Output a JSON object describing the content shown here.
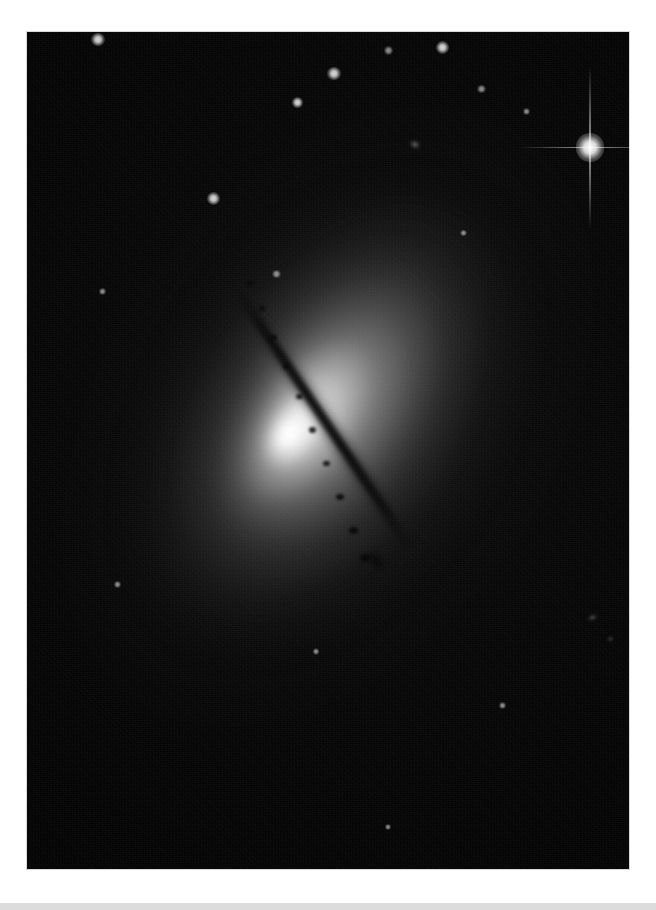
{
  "page": {
    "background_color": "#ffffff",
    "width": 656,
    "height": 910
  },
  "photo": {
    "alt_title": "Edge-on lenticular galaxy with dark dust lane",
    "plate_background": "#040404",
    "border_color": "#d8d8d8",
    "left": 27,
    "top": 32,
    "width": 602,
    "height": 837,
    "subject": "galaxy",
    "orientation_note": "dust lane runs from upper-left to lower-right",
    "core_color": "#ffffff",
    "halo_color": "#9a9a9a",
    "dust_lane_color": "#060606",
    "sky_color": "#050505"
  },
  "galaxy": {
    "name": "edge-on-galaxy",
    "disk_angle_deg": 56,
    "halo_angle_deg": -56,
    "core": {
      "x_pct": 44.5,
      "y_pct": 47.5
    },
    "dust_lane": {
      "start_x_pct": 35,
      "start_y_pct": 27,
      "end_x_pct": 58,
      "end_y_pct": 64
    }
  },
  "field_objects": [
    {
      "name": "bright-star-with-diffraction-spikes",
      "x_pct": 93.5,
      "y_pct": 13.8,
      "size": 13,
      "brightness": "bright"
    },
    {
      "name": "star-upper-left",
      "x_pct": 11.8,
      "y_pct": 0.9,
      "size": 6,
      "brightness": "medium"
    },
    {
      "name": "star-upper-middle",
      "x_pct": 51.0,
      "y_pct": 5.0,
      "size": 6,
      "brightness": "medium"
    },
    {
      "name": "star-upper-middle-left",
      "x_pct": 45.0,
      "y_pct": 8.4,
      "size": 5,
      "brightness": "medium"
    },
    {
      "name": "star-upper-right-a",
      "x_pct": 69.0,
      "y_pct": 1.9,
      "size": 6,
      "brightness": "medium"
    },
    {
      "name": "star-upper-right-b",
      "x_pct": 60.0,
      "y_pct": 2.2,
      "size": 4,
      "brightness": "faint"
    },
    {
      "name": "star-upper-right-c",
      "x_pct": 75.5,
      "y_pct": 6.8,
      "size": 4,
      "brightness": "faint"
    },
    {
      "name": "star-over-halo",
      "x_pct": 31.0,
      "y_pct": 19.9,
      "size": 6,
      "brightness": "medium"
    },
    {
      "name": "star-near-dust-lane",
      "x_pct": 41.5,
      "y_pct": 28.9,
      "size": 4,
      "brightness": "faint"
    },
    {
      "name": "star-left-halo",
      "x_pct": 12.5,
      "y_pct": 31.0,
      "size": 3,
      "brightness": "faint"
    },
    {
      "name": "star-mid-right",
      "x_pct": 72.5,
      "y_pct": 24.0,
      "size": 3,
      "brightness": "faint"
    },
    {
      "name": "star-right-upper",
      "x_pct": 83.0,
      "y_pct": 9.5,
      "size": 3,
      "brightness": "faint"
    },
    {
      "name": "star-lower-left",
      "x_pct": 15.0,
      "y_pct": 66.0,
      "size": 3,
      "brightness": "faint"
    },
    {
      "name": "star-lower-center",
      "x_pct": 48.0,
      "y_pct": 74.0,
      "size": 3,
      "brightness": "faint"
    },
    {
      "name": "star-lower-right",
      "x_pct": 79.0,
      "y_pct": 80.5,
      "size": 3,
      "brightness": "faint"
    },
    {
      "name": "star-bottom-edge",
      "x_pct": 60.0,
      "y_pct": 95.0,
      "size": 3,
      "brightness": "faint"
    }
  ],
  "background_galaxies": [
    {
      "name": "background-galaxy-right",
      "x_pct": 94.0,
      "y_pct": 70.0,
      "w": 11,
      "h": 5,
      "angle": -18
    },
    {
      "name": "background-galaxy-upper-right",
      "x_pct": 64.5,
      "y_pct": 13.5,
      "w": 12,
      "h": 9,
      "angle": 20
    },
    {
      "name": "background-galaxy-right-mid",
      "x_pct": 97.0,
      "y_pct": 72.5,
      "w": 7,
      "h": 4,
      "angle": 0
    }
  ],
  "dust_knots": [
    {
      "x_pct": 37.2,
      "y_pct": 30.0,
      "w": 7,
      "h": 5
    },
    {
      "x_pct": 39.0,
      "y_pct": 33.0,
      "w": 6,
      "h": 5
    },
    {
      "x_pct": 41.0,
      "y_pct": 36.5,
      "w": 7,
      "h": 5
    },
    {
      "x_pct": 43.0,
      "y_pct": 40.0,
      "w": 6,
      "h": 5
    },
    {
      "x_pct": 45.2,
      "y_pct": 43.5,
      "w": 7,
      "h": 5
    },
    {
      "x_pct": 47.5,
      "y_pct": 47.5,
      "w": 7,
      "h": 6
    },
    {
      "x_pct": 49.8,
      "y_pct": 51.5,
      "w": 7,
      "h": 5
    },
    {
      "x_pct": 52.0,
      "y_pct": 55.5,
      "w": 8,
      "h": 6
    },
    {
      "x_pct": 54.3,
      "y_pct": 59.5,
      "w": 9,
      "h": 7
    },
    {
      "x_pct": 56.2,
      "y_pct": 62.8,
      "w": 10,
      "h": 8
    }
  ],
  "bottom_bar": {
    "name": "page-footer-bar",
    "color": "#dcdcdc",
    "height": 7
  }
}
